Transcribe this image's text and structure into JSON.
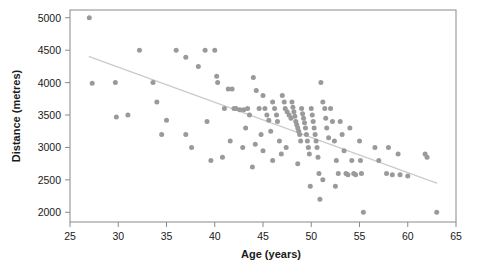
{
  "chart_data": {
    "type": "scatter",
    "title": "",
    "xlabel": "Age (years)",
    "ylabel": "Distance (metres)",
    "xlim": [
      25,
      65
    ],
    "ylim": [
      1850,
      5120
    ],
    "xticks": [
      25,
      30,
      35,
      40,
      45,
      50,
      55,
      60,
      65
    ],
    "yticks": [
      2000,
      2500,
      3000,
      3500,
      4000,
      4500,
      5000
    ],
    "grid": false,
    "legend": null,
    "point_color": "#9a9a9a",
    "point_size": 5,
    "trendline": {
      "name": "linear fit",
      "color": "#cbcbcb",
      "width": 1.4,
      "x": [
        27.0,
        63.0
      ],
      "y": [
        4400,
        2450
      ]
    },
    "series": [
      {
        "name": "runners",
        "color": "#9a9a9a",
        "points": [
          [
            27.0,
            5000
          ],
          [
            27.3,
            3990
          ],
          [
            29.7,
            4000
          ],
          [
            29.8,
            3470
          ],
          [
            31.0,
            3500
          ],
          [
            32.2,
            4500
          ],
          [
            33.6,
            4000
          ],
          [
            34.0,
            3700
          ],
          [
            34.5,
            3200
          ],
          [
            35.0,
            3420
          ],
          [
            36.0,
            4500
          ],
          [
            37.0,
            4390
          ],
          [
            37.0,
            3200
          ],
          [
            37.6,
            3000
          ],
          [
            38.3,
            4250
          ],
          [
            39.0,
            4500
          ],
          [
            39.2,
            3400
          ],
          [
            39.6,
            2800
          ],
          [
            40.0,
            4500
          ],
          [
            40.2,
            4100
          ],
          [
            40.3,
            4000
          ],
          [
            41.0,
            3600
          ],
          [
            41.4,
            3900
          ],
          [
            41.8,
            3900
          ],
          [
            42.0,
            3600
          ],
          [
            42.2,
            3600
          ],
          [
            42.6,
            3580
          ],
          [
            42.9,
            3000
          ],
          [
            43.0,
            3580
          ],
          [
            43.4,
            3600
          ],
          [
            43.6,
            3500
          ],
          [
            43.9,
            2700
          ],
          [
            44.0,
            4080
          ],
          [
            44.3,
            3880
          ],
          [
            44.6,
            3600
          ],
          [
            44.8,
            3200
          ],
          [
            45.0,
            3800
          ],
          [
            45.2,
            3600
          ],
          [
            45.4,
            3500
          ],
          [
            45.6,
            3420
          ],
          [
            45.8,
            3250
          ],
          [
            46.0,
            3700
          ],
          [
            46.2,
            3600
          ],
          [
            46.4,
            3500
          ],
          [
            46.5,
            3400
          ],
          [
            46.7,
            3100
          ],
          [
            46.9,
            2900
          ],
          [
            47.0,
            3800
          ],
          [
            47.2,
            3700
          ],
          [
            47.3,
            3600
          ],
          [
            47.5,
            3550
          ],
          [
            47.7,
            3500
          ],
          [
            47.9,
            3450
          ],
          [
            48.0,
            3700
          ],
          [
            48.1,
            3620
          ],
          [
            48.2,
            3550
          ],
          [
            48.3,
            3480
          ],
          [
            48.4,
            3400
          ],
          [
            48.5,
            3350
          ],
          [
            48.6,
            3300
          ],
          [
            48.7,
            3250
          ],
          [
            48.8,
            3200
          ],
          [
            48.9,
            3100
          ],
          [
            49.0,
            3600
          ],
          [
            49.1,
            3520
          ],
          [
            49.2,
            3450
          ],
          [
            49.3,
            3380
          ],
          [
            49.4,
            3300
          ],
          [
            49.5,
            3200
          ],
          [
            49.6,
            3100
          ],
          [
            49.7,
            3000
          ],
          [
            49.8,
            2900
          ],
          [
            50.0,
            3600
          ],
          [
            50.1,
            3500
          ],
          [
            50.2,
            3400
          ],
          [
            50.3,
            3300
          ],
          [
            50.4,
            3200
          ],
          [
            50.5,
            3100
          ],
          [
            50.6,
            3000
          ],
          [
            50.7,
            2850
          ],
          [
            50.8,
            2600
          ],
          [
            51.0,
            4000
          ],
          [
            51.2,
            3700
          ],
          [
            51.4,
            3600
          ],
          [
            51.5,
            3450
          ],
          [
            51.6,
            3300
          ],
          [
            51.8,
            3150
          ],
          [
            52.0,
            3600
          ],
          [
            52.2,
            3400
          ],
          [
            52.4,
            3100
          ],
          [
            52.6,
            2800
          ],
          [
            52.8,
            2600
          ],
          [
            53.0,
            3400
          ],
          [
            53.2,
            3200
          ],
          [
            53.4,
            2950
          ],
          [
            53.6,
            2600
          ],
          [
            53.8,
            2580
          ],
          [
            54.0,
            3300
          ],
          [
            54.2,
            2800
          ],
          [
            54.4,
            2600
          ],
          [
            54.6,
            2580
          ],
          [
            55.0,
            3100
          ],
          [
            55.1,
            2800
          ],
          [
            55.2,
            2600
          ],
          [
            55.4,
            2000
          ],
          [
            56.6,
            3000
          ],
          [
            57.0,
            2800
          ],
          [
            57.8,
            2600
          ],
          [
            58.0,
            3000
          ],
          [
            58.4,
            2580
          ],
          [
            59.0,
            2900
          ],
          [
            59.2,
            2580
          ],
          [
            60.0,
            2560
          ],
          [
            61.8,
            2900
          ],
          [
            62.0,
            2850
          ],
          [
            63.0,
            2000
          ],
          [
            45.0,
            2950
          ],
          [
            46.0,
            2800
          ],
          [
            47.4,
            3000
          ],
          [
            48.6,
            2750
          ],
          [
            49.9,
            2400
          ],
          [
            51.2,
            2500
          ],
          [
            52.5,
            2400
          ],
          [
            44.2,
            3050
          ],
          [
            43.2,
            3300
          ],
          [
            41.6,
            3100
          ],
          [
            40.8,
            2850
          ],
          [
            50.9,
            2200
          ]
        ]
      }
    ]
  }
}
